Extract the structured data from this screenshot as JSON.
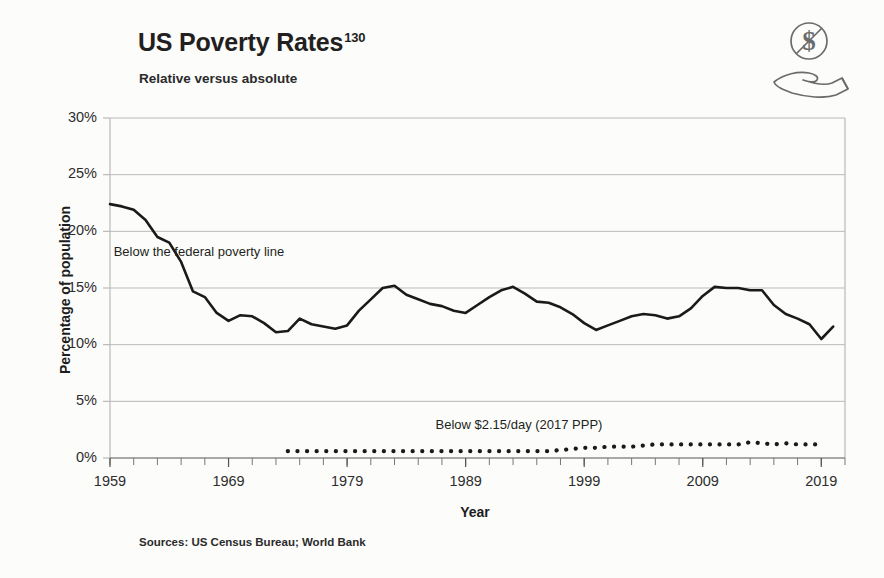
{
  "header": {
    "title": "US Poverty Rates",
    "title_superscript": "130",
    "subtitle": "Relative versus absolute",
    "icon_name": "no-money-in-hand-icon"
  },
  "source_note": "Sources: US Census Bureau; World Bank",
  "colors": {
    "line": "#1a1a1a",
    "grid": "#b9b9b9",
    "text": "#231f20",
    "background": "#fcfcfb"
  },
  "chart_data": {
    "type": "line",
    "title": "US Poverty Rates",
    "subtitle": "Relative versus absolute",
    "xlabel": "Year",
    "ylabel": "Percentage of population",
    "xlim": [
      1959,
      2021
    ],
    "ylim": [
      0,
      30
    ],
    "grid": true,
    "legend_position": "inline-annotations",
    "x_tick_labels": [
      "1959",
      "1969",
      "1979",
      "1989",
      "1999",
      "2009",
      "2019"
    ],
    "x_tick_values": [
      1959,
      1969,
      1979,
      1989,
      1999,
      2009,
      2019
    ],
    "x_minor_tick_step": 2,
    "y_tick_labels": [
      "0%",
      "5%",
      "10%",
      "15%",
      "20%",
      "25%",
      "30%"
    ],
    "y_tick_values": [
      0,
      5,
      10,
      15,
      20,
      25,
      30
    ],
    "annotations": [
      {
        "text": "Below the federal poverty line",
        "x": 1966.5,
        "y": 17.8
      },
      {
        "text": "Below $2.15/day (2017 PPP)",
        "x": 1993.5,
        "y": 2.6
      }
    ],
    "series": [
      {
        "name": "Below the federal poverty line",
        "style": "solid",
        "x": [
          1959,
          1960,
          1961,
          1962,
          1963,
          1964,
          1965,
          1966,
          1967,
          1968,
          1969,
          1970,
          1971,
          1972,
          1973,
          1974,
          1975,
          1976,
          1977,
          1978,
          1979,
          1980,
          1981,
          1982,
          1983,
          1984,
          1985,
          1986,
          1987,
          1988,
          1989,
          1990,
          1991,
          1992,
          1993,
          1994,
          1995,
          1996,
          1997,
          1998,
          1999,
          2000,
          2001,
          2002,
          2003,
          2004,
          2005,
          2006,
          2007,
          2008,
          2009,
          2010,
          2011,
          2012,
          2013,
          2014,
          2015,
          2016,
          2017,
          2018,
          2019,
          2020
        ],
        "values": [
          22.4,
          22.2,
          21.9,
          21.0,
          19.5,
          19.0,
          17.3,
          14.7,
          14.2,
          12.8,
          12.1,
          12.6,
          12.5,
          11.9,
          11.1,
          11.2,
          12.3,
          11.8,
          11.6,
          11.4,
          11.7,
          13.0,
          14.0,
          15.0,
          15.2,
          14.4,
          14.0,
          13.6,
          13.4,
          13.0,
          12.8,
          13.5,
          14.2,
          14.8,
          15.1,
          14.5,
          13.8,
          13.7,
          13.3,
          12.7,
          11.9,
          11.3,
          11.7,
          12.1,
          12.5,
          12.7,
          12.6,
          12.3,
          12.5,
          13.2,
          14.3,
          15.1,
          15.0,
          15.0,
          14.8,
          14.8,
          13.5,
          12.7,
          12.3,
          11.8,
          10.5,
          11.6
        ]
      },
      {
        "name": "Below $2.15/day (2017 PPP)",
        "style": "dotted",
        "x": [
          1974,
          1975,
          1976,
          1977,
          1978,
          1979,
          1980,
          1981,
          1982,
          1983,
          1984,
          1985,
          1986,
          1987,
          1988,
          1989,
          1990,
          1991,
          1992,
          1993,
          1994,
          1995,
          1996,
          1997,
          1998,
          1999,
          2000,
          2001,
          2002,
          2003,
          2004,
          2005,
          2006,
          2007,
          2008,
          2009,
          2010,
          2011,
          2012,
          2013,
          2014,
          2015,
          2016,
          2017,
          2018,
          2019
        ],
        "values": [
          0.6,
          0.6,
          0.6,
          0.6,
          0.6,
          0.6,
          0.6,
          0.6,
          0.6,
          0.6,
          0.6,
          0.6,
          0.6,
          0.6,
          0.6,
          0.6,
          0.6,
          0.6,
          0.6,
          0.6,
          0.6,
          0.6,
          0.6,
          0.7,
          0.8,
          0.9,
          0.9,
          1.0,
          1.0,
          1.0,
          1.1,
          1.2,
          1.2,
          1.2,
          1.2,
          1.2,
          1.2,
          1.2,
          1.2,
          1.4,
          1.3,
          1.2,
          1.3,
          1.2,
          1.2,
          1.2
        ]
      }
    ]
  }
}
